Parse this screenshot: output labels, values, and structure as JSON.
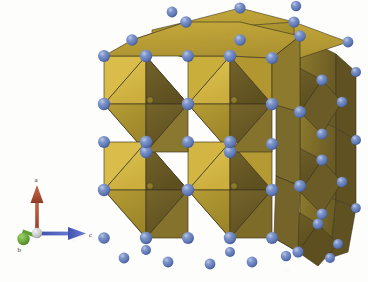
{
  "figure": {
    "kind": "crystal-structure-render",
    "background_color": "#fdfdfc"
  },
  "axis_indicator": {
    "name": "crystallographic-axes",
    "axes": [
      {
        "id": "a",
        "label": "a",
        "color": "#a8442a",
        "direction": "up"
      },
      {
        "id": "b",
        "label": "b",
        "color": "#5f9e36",
        "direction": "down-left"
      },
      {
        "id": "c",
        "label": "c",
        "color": "#4a5fc0",
        "direction": "right"
      }
    ],
    "origin_color": "#bdbdbd"
  },
  "legend": {
    "octahedron_face_bright": "#d9bc4a",
    "octahedron_face_mid": "#a8902f",
    "octahedron_face_dark": "#6b5b26",
    "octahedron_face_shadow": "#7a6a2c",
    "sphere_color": "#7089c2",
    "sphere_highlight": "#aabce0",
    "sphere_shadow": "#43588f",
    "edge_color": "#3d3520"
  },
  "structure": {
    "cells_across": 2,
    "cells_down": 2,
    "cells_deep": 2,
    "octahedra_visible": 12,
    "vertex_spheres_visible": 54
  }
}
